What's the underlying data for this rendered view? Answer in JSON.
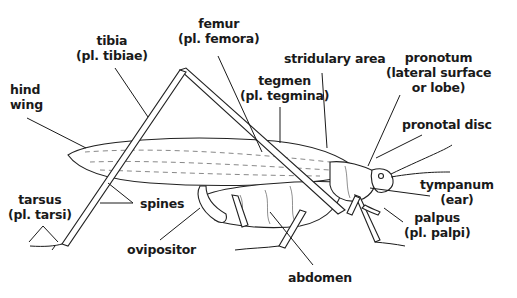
{
  "diagram": {
    "labels": {
      "femur": {
        "line1": "femur",
        "line2": "(pl. femora)"
      },
      "tibia": {
        "line1": "tibia",
        "line2": "(pl. tibiae)"
      },
      "hind_wing": {
        "line1": "hind",
        "line2": "wing"
      },
      "tegmen": {
        "line1": "tegmen",
        "line2": "(pl. tegmina)"
      },
      "stridulary_area": {
        "line1": "stridulary area"
      },
      "pronotum": {
        "line1": "pronotum",
        "line2": "(lateral surface",
        "line3": "or lobe)"
      },
      "pronotal_disc": {
        "line1": "pronotal disc"
      },
      "tympanum": {
        "line1": "tympanum",
        "line2": "(ear)"
      },
      "palpus": {
        "line1": "palpus",
        "line2": "(pl. palpi)"
      },
      "tarsus": {
        "line1": "tarsus",
        "line2": "(pl. tarsi)"
      },
      "spines": {
        "line1": "spines"
      },
      "ovipositor": {
        "line1": "ovipositor"
      },
      "abdomen": {
        "line1": "abdomen"
      }
    }
  }
}
